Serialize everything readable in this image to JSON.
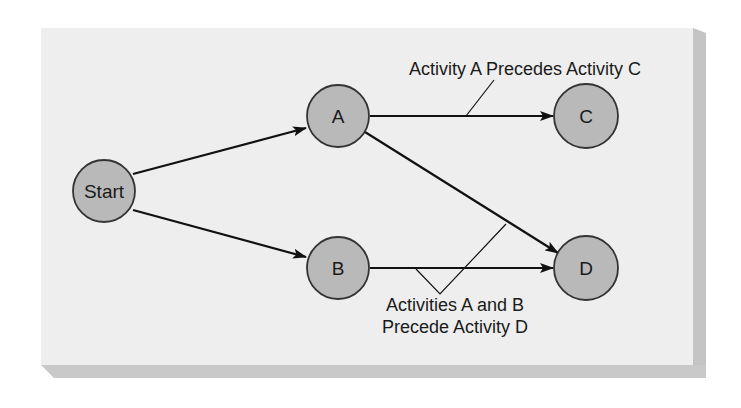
{
  "diagram": {
    "type": "activity-on-node network",
    "colors": {
      "panel": "#eeeeee",
      "panel_shadow": "#c4c4c4",
      "node_fill": "#b9b9b9",
      "node_stroke": "#333333",
      "edge": "#111111"
    },
    "nodes": [
      {
        "id": "start",
        "label": "Start"
      },
      {
        "id": "a",
        "label": "A"
      },
      {
        "id": "b",
        "label": "B"
      },
      {
        "id": "c",
        "label": "C"
      },
      {
        "id": "d",
        "label": "D"
      }
    ],
    "edges": [
      {
        "from": "Start",
        "to": "A"
      },
      {
        "from": "Start",
        "to": "B"
      },
      {
        "from": "A",
        "to": "C"
      },
      {
        "from": "A",
        "to": "D"
      },
      {
        "from": "B",
        "to": "D"
      }
    ],
    "annotations": {
      "a_precedes_c": "Activity A Precedes Activity C",
      "ab_precede_d_line1": "Activities A and B",
      "ab_precede_d_line2": "Precede Activity D"
    }
  }
}
